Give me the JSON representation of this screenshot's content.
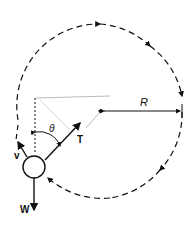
{
  "diagram": {
    "labels": {
      "radius": "R",
      "angle": "θ",
      "tension": "T",
      "velocity": "v",
      "weight": "W"
    },
    "colors": {
      "ink": "#111111",
      "string": "#bbbbbb",
      "background": "#ffffff"
    }
  }
}
